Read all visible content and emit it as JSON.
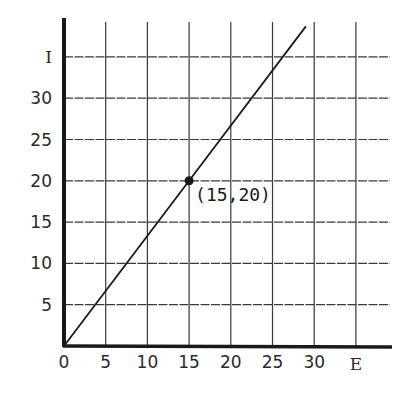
{
  "chart_data": {
    "type": "line",
    "title": "",
    "xlabel": "E",
    "ylabel": "I",
    "xlim": [
      0,
      35
    ],
    "ylim": [
      0,
      35
    ],
    "grid": true,
    "x_ticks": [
      0,
      5,
      10,
      15,
      20,
      25,
      30
    ],
    "x_tick_labels": [
      "0",
      "5",
      "10",
      "15",
      "20",
      "25",
      "30"
    ],
    "y_ticks": [
      5,
      10,
      15,
      20,
      25,
      30
    ],
    "y_tick_labels": [
      "5",
      "10",
      "15",
      "20",
      "25",
      "30"
    ],
    "series": [
      {
        "name": "I vs E",
        "x": [
          0,
          15,
          29
        ],
        "y": [
          0,
          20,
          38.7
        ],
        "slope": 1.333
      }
    ],
    "points": [
      {
        "x": 15,
        "y": 20,
        "label": "(15,20)"
      }
    ],
    "legend": null
  },
  "colors": {
    "ink": "#1a1a1a",
    "grid": "#3a3a3a",
    "background": "#ffffff"
  }
}
